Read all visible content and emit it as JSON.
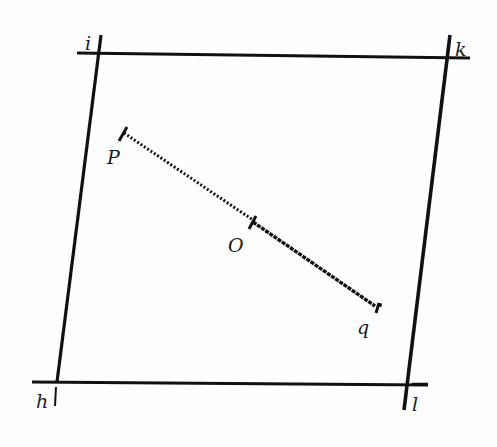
{
  "figure": {
    "labels": {
      "i": "i",
      "k": "k",
      "h": "h",
      "l": "l",
      "P": "P",
      "O": "O",
      "q": "q"
    },
    "colors": {
      "ink": "#111111",
      "paper": "#fefefe"
    },
    "quadrilateral": {
      "corners": {
        "i": [
          97,
          53
        ],
        "k": [
          449,
          58
        ],
        "h": [
          57,
          382
        ],
        "l": [
          408,
          384
        ]
      }
    },
    "segment": {
      "P": [
        124,
        130
      ],
      "O": [
        253,
        220
      ],
      "q": [
        379,
        308
      ]
    }
  }
}
